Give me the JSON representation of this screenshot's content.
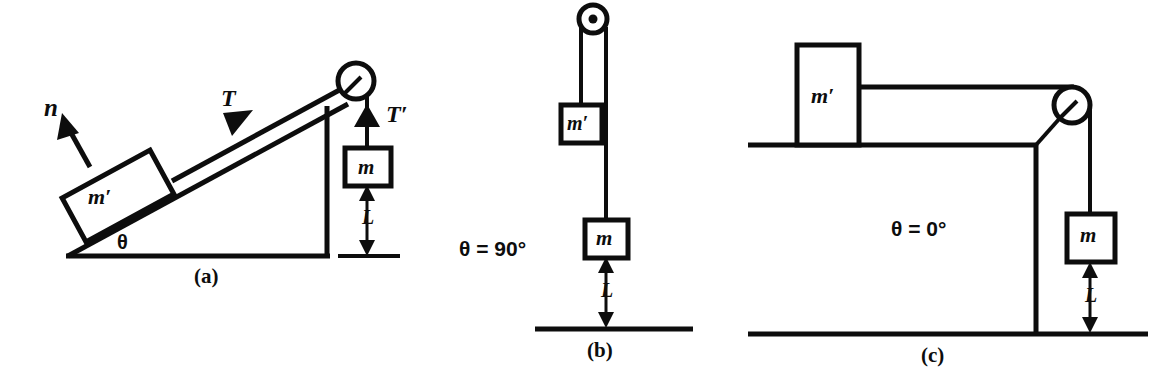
{
  "figure": {
    "type": "physics-diagram",
    "ink_color": "#0d0d0d",
    "background_color": "#ffffff"
  },
  "panels": [
    {
      "key": "a",
      "caption": "(a)",
      "angle_label": "θ",
      "labels": {
        "normal_force": "n",
        "tension_incline": "T",
        "tension_hanging": "T′",
        "block_incline": "m′",
        "hanging_mass": "m",
        "height": "L"
      },
      "elements": [
        "inclined-plane",
        "block-on-incline",
        "normal-force-arrow",
        "tension-arrow",
        "rope",
        "pulley",
        "hanging-mass",
        "tension-prime-arrow",
        "height-dimension",
        "ground-line"
      ]
    },
    {
      "key": "b",
      "caption": "(b)",
      "angle_label": "θ = 90°",
      "labels": {
        "block_incline": "m′",
        "hanging_mass": "m",
        "height": "L"
      },
      "elements": [
        "pulley",
        "left-rope-strand",
        "right-rope-strand",
        "block-m-prime",
        "hanging-mass",
        "height-dimension",
        "ground-line"
      ]
    },
    {
      "key": "c",
      "caption": "(c)",
      "angle_label": "θ = 0°",
      "labels": {
        "block_incline": "m′",
        "hanging_mass": "m",
        "height": "L"
      },
      "elements": [
        "table-top",
        "table-leg",
        "block-m-prime",
        "rope",
        "pulley",
        "hanging-mass",
        "height-dimension",
        "ground-line"
      ]
    }
  ]
}
